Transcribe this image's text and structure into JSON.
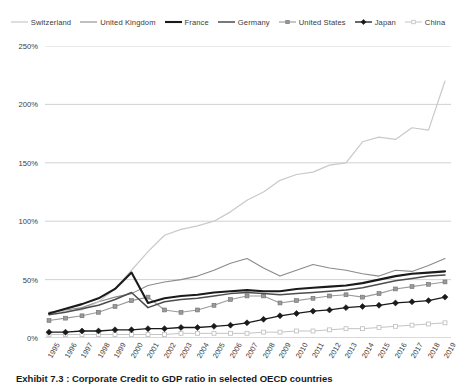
{
  "caption": "Exhibit 7.3 : Corporate Credit to GDP ratio in selected OECD countries",
  "legend": {
    "position": "top",
    "items": [
      {
        "label": "Switzerland",
        "color": "#c9c9c9",
        "width": 1.2,
        "marker": "none"
      },
      {
        "label": "United Kingdom",
        "color": "#8a8a8a",
        "width": 1.1,
        "marker": "none"
      },
      {
        "label": "France",
        "color": "#1a1a1a",
        "width": 2.1,
        "marker": "none"
      },
      {
        "label": "Germany",
        "color": "#4d4d4d",
        "width": 1.5,
        "marker": "none"
      },
      {
        "label": "United States",
        "color": "#9a9a9a",
        "width": 1.1,
        "marker": "square"
      },
      {
        "label": "Japan",
        "color": "#1a1a1a",
        "width": 1.3,
        "marker": "diamond"
      },
      {
        "label": "China",
        "color": "#c4c4c4",
        "width": 1.0,
        "marker": "square-open"
      }
    ]
  },
  "axes": {
    "y_label": "",
    "x_label": "",
    "y_ticks": [
      "0%",
      "50%",
      "100%",
      "150%",
      "200%",
      "250%"
    ],
    "y_tick_values": [
      0,
      50,
      100,
      150,
      200,
      250
    ],
    "ylim": [
      0,
      250
    ],
    "grid": "horizontal"
  },
  "chart_data": {
    "type": "line",
    "title": "Exhibit 7.3 : Corporate Credit to GDP ratio in selected OECD countries",
    "xlabel": "",
    "ylabel": "",
    "ylim": [
      0,
      250
    ],
    "grid": true,
    "legend_position": "top",
    "categories": [
      "1995",
      "1996",
      "1997",
      "1998",
      "1999",
      "2000",
      "2001",
      "2002",
      "2003",
      "2004",
      "2005",
      "2006",
      "2007",
      "2008",
      "2009",
      "2010",
      "2011",
      "2012",
      "2013",
      "2014",
      "2015",
      "2016",
      "2017",
      "2018",
      "2019"
    ],
    "series": [
      {
        "name": "Switzerland",
        "color": "#c9c9c9",
        "values": [
          22,
          23,
          24,
          31,
          42,
          58,
          74,
          88,
          93,
          96,
          100,
          108,
          118,
          125,
          135,
          140,
          142,
          148,
          150,
          168,
          172,
          170,
          180,
          178,
          220
        ]
      },
      {
        "name": "United Kingdom",
        "color": "#8a8a8a",
        "values": [
          22,
          24,
          26,
          31,
          35,
          38,
          45,
          48,
          50,
          53,
          58,
          64,
          68,
          60,
          53,
          58,
          63,
          60,
          58,
          55,
          53,
          58,
          57,
          62,
          68
        ]
      },
      {
        "name": "France",
        "color": "#1a1a1a",
        "values": [
          21,
          25,
          29,
          34,
          42,
          56,
          30,
          34,
          36,
          37,
          39,
          40,
          41,
          40,
          40,
          42,
          43,
          44,
          45,
          47,
          50,
          53,
          55,
          56,
          57
        ]
      },
      {
        "name": "Germany",
        "color": "#4d4d4d",
        "values": [
          20,
          22,
          25,
          28,
          33,
          39,
          26,
          31,
          33,
          34,
          36,
          38,
          39,
          38,
          37,
          38,
          39,
          40,
          41,
          43,
          46,
          49,
          51,
          53,
          54
        ]
      },
      {
        "name": "United States",
        "color": "#9a9a9a",
        "values": [
          15,
          17,
          19,
          22,
          27,
          32,
          35,
          24,
          22,
          24,
          28,
          33,
          36,
          36,
          30,
          32,
          34,
          36,
          37,
          35,
          38,
          42,
          44,
          46,
          48
        ]
      },
      {
        "name": "Japan",
        "color": "#1a1a1a",
        "values": [
          5,
          5,
          6,
          6,
          7,
          7,
          8,
          8,
          9,
          9,
          10,
          11,
          13,
          16,
          19,
          21,
          23,
          24,
          26,
          27,
          28,
          30,
          31,
          32,
          35
        ]
      },
      {
        "name": "China",
        "color": "#c4c4c4",
        "values": [
          3,
          3,
          3,
          3,
          3,
          3,
          3,
          3,
          4,
          4,
          4,
          4,
          4,
          5,
          5,
          6,
          6,
          7,
          8,
          8,
          9,
          10,
          11,
          12,
          13
        ]
      }
    ]
  }
}
